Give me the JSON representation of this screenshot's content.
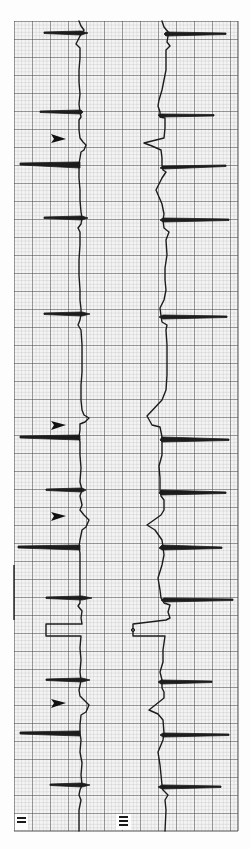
{
  "figure": {
    "paper_color": "#fdfdfd",
    "grid_minor_color": "#9a9a9a",
    "grid_major_color": "#3a3a3a",
    "trace_color": "#1c1c1c",
    "leads": [
      {
        "label": "II",
        "position": "left"
      },
      {
        "label": "III",
        "position": "right"
      }
    ],
    "arrowheads_count": 4
  }
}
